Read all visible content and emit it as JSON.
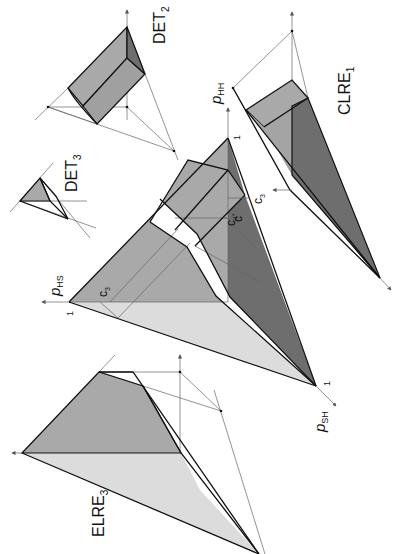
{
  "figure": {
    "colors": {
      "light": "#dcdcdc",
      "medium": "#a9a9a9",
      "dark": "#6e6e6e",
      "line": "#111111",
      "guide": "#666666",
      "background": "#ffffff"
    }
  },
  "panels": {
    "main": {
      "axis_hh": {
        "label": "p",
        "sub": "HH",
        "tick": "1"
      },
      "axis_hs": {
        "label": "p",
        "sub": "HS",
        "tick": "1"
      },
      "axis_sh": {
        "label": "p",
        "sub": "SH",
        "tick": "1"
      },
      "annotations": {
        "c3_top": {
          "label": "c",
          "sub": "3"
        },
        "c4": {
          "label": "c",
          "sub": "4"
        },
        "cstar": {
          "label": "c",
          "sub": "*"
        },
        "c3_left": {
          "label": "c",
          "sub": "3"
        }
      }
    },
    "det2": {
      "label": "DET",
      "sub": "2"
    },
    "det3": {
      "label": "DET",
      "sub": "3"
    },
    "clre1": {
      "label": "CLRE",
      "sub": "1"
    },
    "elre3": {
      "label": "ELRE",
      "sub": "3"
    }
  }
}
